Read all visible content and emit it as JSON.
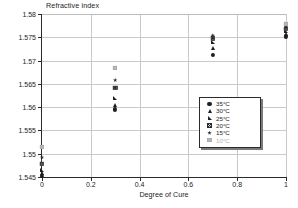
{
  "chart_data": {
    "type": "scatter",
    "title": "",
    "ylabel": "Refractive index",
    "xlabel": "Degree of Cure",
    "xlim": [
      0,
      1
    ],
    "ylim": [
      1.545,
      1.58
    ],
    "xticks": [
      "0",
      "0.2",
      "0.4",
      "0.6",
      "0.8",
      "1"
    ],
    "xtick_values": [
      0,
      0.2,
      0.4,
      0.6,
      0.8,
      1
    ],
    "yticks": [
      "1.545",
      "1.55",
      "1.555",
      "1.56",
      "1.565",
      "1.57",
      "1.575",
      "1.58"
    ],
    "ytick_values": [
      1.545,
      1.55,
      1.555,
      1.56,
      1.565,
      1.57,
      1.575,
      1.58
    ],
    "grid": true,
    "legend_position": "right-middle",
    "series": [
      {
        "name": "35°C",
        "marker": "circle",
        "color": "#1f1f1f",
        "points": [
          [
            0.0,
            1.5452
          ],
          [
            0.3,
            1.5595
          ],
          [
            0.7,
            1.5712
          ],
          [
            1.0,
            1.5752
          ]
        ]
      },
      {
        "name": "30°C",
        "marker": "triangle-up",
        "color": "#1f1f1f",
        "points": [
          [
            0.0,
            1.5459
          ],
          [
            0.3,
            1.5605
          ],
          [
            0.7,
            1.5726
          ],
          [
            1.0,
            1.5758
          ]
        ]
      },
      {
        "name": "25°C",
        "marker": "right-triangle",
        "color": "#1f1f1f",
        "points": [
          [
            0.0,
            1.5466
          ],
          [
            0.3,
            1.5619
          ],
          [
            0.7,
            1.5739
          ],
          [
            1.0,
            1.5763
          ]
        ]
      },
      {
        "name": "20°C",
        "marker": "crossed-square",
        "color": "#2b2b2b",
        "points": [
          [
            0.0,
            1.5478
          ],
          [
            0.3,
            1.5642
          ],
          [
            0.7,
            1.5748
          ],
          [
            1.0,
            1.5768
          ]
        ]
      },
      {
        "name": "15°C",
        "marker": "star",
        "color": "#2a2a2a",
        "points": [
          [
            0.0,
            1.5492
          ],
          [
            0.3,
            1.5658
          ],
          [
            0.7,
            1.5754
          ],
          [
            1.0,
            1.5772
          ]
        ]
      },
      {
        "name": "10°C",
        "marker": "gray-square",
        "color": "#b9b9b9",
        "points": [
          [
            0.0,
            1.5514
          ],
          [
            0.3,
            1.5685
          ],
          [
            1.0,
            1.5779
          ]
        ]
      }
    ]
  }
}
